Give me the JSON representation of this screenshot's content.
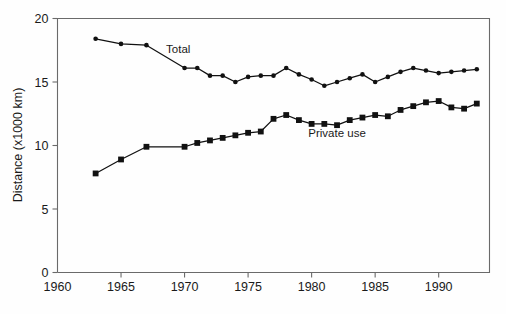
{
  "chart_data": {
    "type": "line",
    "title": "",
    "xlabel": "",
    "ylabel": "Distance (x1000 km)",
    "xlim": [
      1960,
      1994
    ],
    "ylim": [
      0,
      20
    ],
    "xticks": [
      1960,
      1965,
      1970,
      1975,
      1980,
      1985,
      1990
    ],
    "yticks": [
      0,
      5,
      10,
      15,
      20
    ],
    "xticklabels": [
      "1960",
      "1965",
      "1970",
      "1975",
      "1980",
      "1985",
      "1990"
    ],
    "yticklabels": [
      "0",
      "5",
      "10",
      "15",
      "20"
    ],
    "grid": false,
    "legend": "inline-annotations",
    "x": [
      1963,
      1965,
      1967,
      1970,
      1971,
      1972,
      1973,
      1974,
      1975,
      1976,
      1977,
      1978,
      1979,
      1980,
      1981,
      1982,
      1983,
      1984,
      1985,
      1986,
      1987,
      1988,
      1989,
      1990,
      1991,
      1992,
      1993
    ],
    "series": [
      {
        "name": "Total",
        "marker": "circle",
        "values": [
          18.4,
          18.0,
          17.9,
          16.1,
          16.1,
          15.5,
          15.5,
          15.0,
          15.4,
          15.5,
          15.5,
          16.1,
          15.6,
          15.2,
          14.7,
          15.0,
          15.3,
          15.6,
          15.0,
          15.4,
          15.8,
          16.1,
          15.9,
          15.7,
          15.8,
          15.9,
          16.0
        ]
      },
      {
        "name": "Private use",
        "marker": "square",
        "values": [
          7.8,
          8.9,
          9.9,
          9.9,
          10.2,
          10.4,
          10.6,
          10.8,
          11.0,
          11.1,
          12.1,
          12.4,
          12.0,
          11.7,
          11.7,
          11.6,
          12.0,
          12.2,
          12.4,
          12.3,
          12.8,
          13.1,
          13.4,
          13.5,
          13.0,
          12.9,
          13.3
        ]
      }
    ],
    "annotations": [
      {
        "text": "Total",
        "x": 1969.5,
        "y": 17.3
      },
      {
        "text": "Private use",
        "x": 1982.0,
        "y": 10.7
      }
    ]
  }
}
